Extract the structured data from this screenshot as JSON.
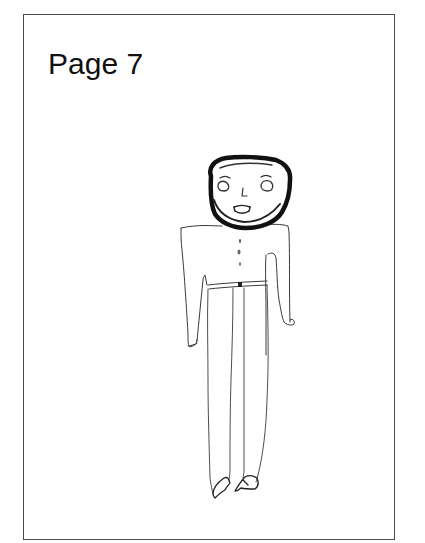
{
  "page": {
    "label": "Page 7",
    "frame_color": "#4a4a4a",
    "text_color": "#111111",
    "background": "#ffffff"
  },
  "drawing": {
    "subject": "hand-drawn standing person",
    "medium": "pencil sketch",
    "parts": [
      "head",
      "eyes",
      "nose",
      "mouth",
      "torso",
      "buttons",
      "left-arm",
      "right-arm",
      "belt",
      "left-leg",
      "right-leg",
      "left-shoe",
      "right-shoe"
    ],
    "stroke_color": "#2a2a2a",
    "head_outline_color": "#111111"
  }
}
